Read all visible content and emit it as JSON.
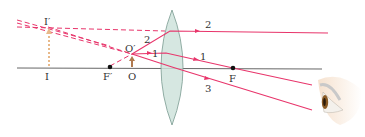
{
  "diagram": {
    "colors": {
      "ray": "#e8356b",
      "axis": "#555555",
      "lens_fill": "#cfe3dc",
      "lens_stroke": "#7a9a90",
      "object_arrow": "#b07a4f",
      "image_arrow": "#e8b98a",
      "point": "#111111"
    },
    "labels": {
      "image_top": "I′",
      "image_base": "I",
      "object_top": "O′",
      "object_base": "O",
      "focal_front": "F′",
      "focal_back": "F",
      "ray1": "1",
      "ray2_left": "2",
      "ray2_right": "2",
      "ray1_left": "1",
      "ray3": "3"
    },
    "elements": {
      "lens": "converging-lens",
      "object": "real-object-arrow",
      "image": "virtual-image-arrow",
      "observer": "eye-icon"
    }
  }
}
